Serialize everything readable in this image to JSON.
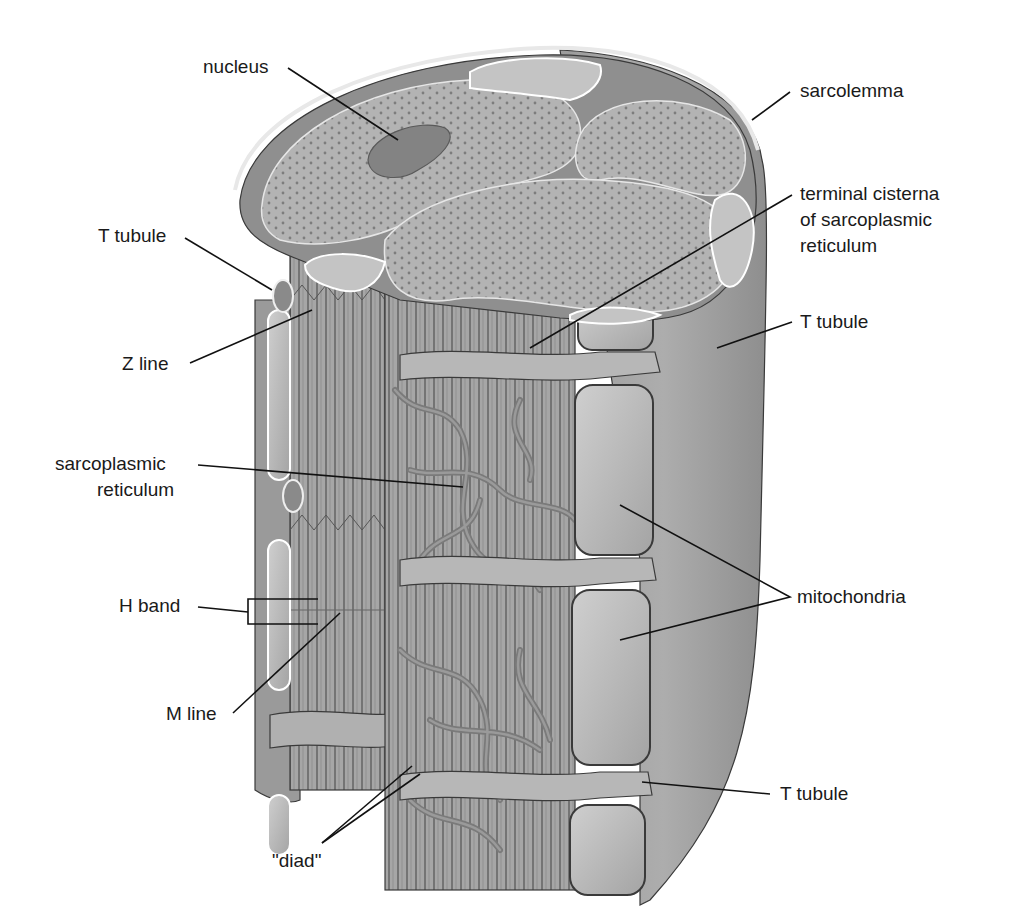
{
  "figure": {
    "palette": {
      "background": "#ffffff",
      "fiber_surface": "#a8a8a8",
      "cross_section": "#b4b4b4",
      "reticulum": "#858585",
      "mitochondria": "#bdbdbd",
      "text": "#1a1a1a",
      "leader_line": "#111111"
    }
  },
  "labels": {
    "nucleus": "nucleus",
    "sarcolemma": "sarcolemma",
    "t_tubule_top_left": "T tubule",
    "terminal_cisterna_line1": "terminal cisterna",
    "terminal_cisterna_line2": "of sarcoplasmic",
    "terminal_cisterna_line3": "reticulum",
    "t_tubule_right_upper": "T tubule",
    "z_line": "Z line",
    "sarcoplasmic_reticulum_line1": "sarcoplasmic",
    "sarcoplasmic_reticulum_line2": "reticulum",
    "mitochondria": "mitochondria",
    "h_band": "H band",
    "m_line": "M line",
    "t_tubule_right_lower": "T tubule",
    "diad": "\"diad\""
  }
}
